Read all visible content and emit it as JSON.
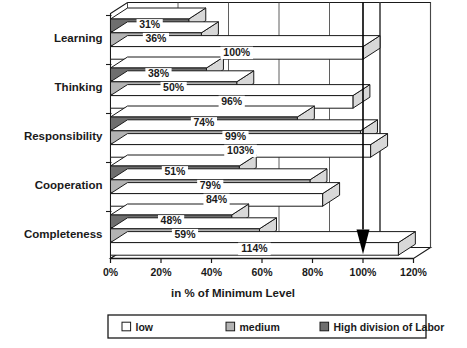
{
  "chart_data": {
    "type": "bar",
    "orientation": "horizontal",
    "title": "",
    "xlabel": "in % of Minimum Level",
    "ylabel": "",
    "xlim": [
      0,
      120
    ],
    "xticks": [
      "0%",
      "20%",
      "40%",
      "60%",
      "80%",
      "100%",
      "120%"
    ],
    "xtick_values": [
      0,
      20,
      40,
      60,
      80,
      100,
      120
    ],
    "grid": true,
    "grid_axis": "x",
    "legend_position": "bottom",
    "categories": [
      "Learning",
      "Thinking",
      "Responsibility",
      "Cooperation",
      "Completeness"
    ],
    "series": [
      {
        "name": "High division of Labor",
        "color": "#6e6e6e",
        "values": [
          31,
          38,
          74,
          51,
          48
        ],
        "labels": [
          "31%",
          "38%",
          "74%",
          "51%",
          "48%"
        ]
      },
      {
        "name": "medium",
        "color": "#b3b3b3",
        "values": [
          36,
          50,
          99,
          79,
          59
        ],
        "labels": [
          "36%",
          "50%",
          "99%",
          "79%",
          "59%"
        ]
      },
      {
        "name": "low",
        "color": "#ffffff",
        "values": [
          100,
          96,
          103,
          84,
          114
        ],
        "labels": [
          "100%",
          "96%",
          "103%",
          "84%",
          "114%"
        ]
      }
    ],
    "annotations": [
      {
        "name": "reference-marker-100",
        "type": "down-arrow",
        "x": 100,
        "note": "100%"
      }
    ]
  },
  "axis": {
    "x_title": "in % of Minimum Level",
    "tick_labels": [
      "0%",
      "20%",
      "40%",
      "60%",
      "80%",
      "100%",
      "120%"
    ]
  },
  "categories": {
    "learning": "Learning",
    "thinking": "Thinking",
    "responsibility": "Responsibility",
    "cooperation": "Cooperation",
    "completeness": "Completeness"
  },
  "legend": {
    "items": [
      {
        "label": "low",
        "swatch": "#ffffff"
      },
      {
        "label": "medium",
        "swatch": "#b3b3b3"
      },
      {
        "label": "High division of Labor",
        "swatch": "#6e6e6e"
      }
    ]
  },
  "values": {
    "learning": {
      "high": "31%",
      "medium": "36%",
      "low": "100%"
    },
    "thinking": {
      "high": "38%",
      "medium": "50%",
      "low": "96%"
    },
    "responsibility": {
      "high": "74%",
      "medium": "99%",
      "low": "103%"
    },
    "cooperation": {
      "high": "51%",
      "medium": "79%",
      "low": "84%"
    },
    "completeness": {
      "high": "48%",
      "medium": "59%",
      "low": "114%"
    }
  },
  "colors": {
    "high": "#6e6e6e",
    "medium": "#b3b3b3",
    "low": "#ffffff",
    "outline": "#1a1a1a",
    "grid": "#4d4d4d"
  }
}
